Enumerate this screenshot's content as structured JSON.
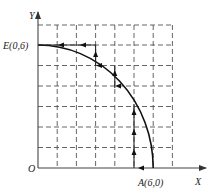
{
  "figure": {
    "type": "coordinate-grid-diagram",
    "axes": {
      "x_label": "X",
      "y_label": "Y",
      "origin_label": "O"
    },
    "points": {
      "E": {
        "label": "E(0,6)",
        "x": 0,
        "y": 6
      },
      "A": {
        "label": "A(6,0)",
        "x": 6,
        "y": 0
      }
    },
    "grid": {
      "x_max": 7,
      "y_max": 7,
      "style": "dashed"
    },
    "curve": {
      "description": "quarter-circle arc from E(0,6) to A(6,0)",
      "from": "E",
      "to": "A"
    },
    "route": {
      "description": "staircase path with direction arrows from A to E",
      "segments": [
        {
          "from": [
            6,
            0
          ],
          "to": [
            5,
            0
          ],
          "arrow": "left"
        },
        {
          "from": [
            5,
            0
          ],
          "to": [
            5,
            3.3
          ],
          "arrow": "up"
        },
        {
          "from": [
            4,
            4
          ],
          "to": [
            4,
            5
          ],
          "arrow": "up"
        },
        {
          "from": [
            3,
            5
          ],
          "to": [
            3,
            6
          ],
          "arrow": "up"
        },
        {
          "from": [
            3,
            6
          ],
          "to": [
            0,
            6
          ],
          "arrow": "left"
        }
      ]
    }
  },
  "colors": {
    "line": "#222222",
    "grid": "#555555",
    "background": "#ffffff"
  }
}
